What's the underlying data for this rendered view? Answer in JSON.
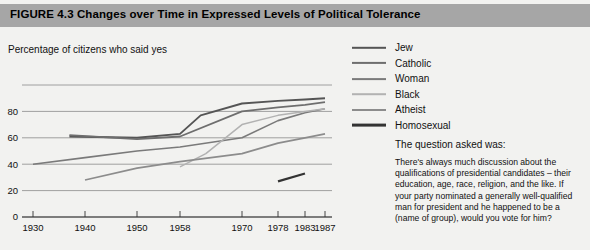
{
  "header": {
    "figure_number": "FIGURE 4.3",
    "title": "FIGURE 4.3  Changes over Time in Expressed Levels of Political Tolerance"
  },
  "axis_caption": "Percentage of citizens who said yes",
  "legend": {
    "items": [
      {
        "label": "Jew",
        "color": "#555555",
        "width": "2.4px"
      },
      {
        "label": "Catholic",
        "color": "#6e6e6e",
        "width": "2.2px"
      },
      {
        "label": "Woman",
        "color": "#7a7a7a",
        "width": "1.8px"
      },
      {
        "label": "Black",
        "color": "#b2b2b2",
        "width": "1.6px"
      },
      {
        "label": "Atheist",
        "color": "#8c8c8c",
        "width": "2.0px"
      },
      {
        "label": "Homosexual",
        "color": "#333333",
        "width": "2.8px"
      }
    ]
  },
  "question": {
    "heading": "The question asked was:",
    "lines": [
      "There's always much discussion about the",
      "qualifications of presidential candidates – their",
      "education, age, race, religion, and the like. If",
      "your party nominated a generally well-qualified",
      "man for president and he happened to be a",
      "(name of group), would you vote for him?"
    ]
  },
  "chart_data": {
    "type": "line",
    "title": "Changes over Time in Expressed Levels of Political Tolerance",
    "xlabel": "",
    "ylabel": "Percentage of citizens who said yes",
    "x_ticks": [
      1930,
      1940,
      1950,
      1958,
      1970,
      1978,
      1983,
      1987
    ],
    "x_tick_labels": [
      "1930",
      "1940",
      "1950",
      "1958",
      "1970",
      "1978",
      "1983",
      "1987"
    ],
    "x_tick_positions": [
      33,
      85,
      137,
      180,
      242,
      278,
      305,
      325
    ],
    "y_ticks": [
      0,
      20,
      40,
      60,
      80,
      100
    ],
    "y_tick_labels": [
      "0",
      "20",
      "40",
      "60",
      "80",
      ""
    ],
    "ylim": [
      0,
      100
    ],
    "grid": true,
    "legend_position": "right",
    "series": [
      {
        "name": "Jew",
        "color": "#555555",
        "stroke_width": 1.9,
        "points": [
          {
            "x": 1937,
            "y": 61
          },
          {
            "x": 1950,
            "y": 60
          },
          {
            "x": 1958,
            "y": 63
          },
          {
            "x": 1962,
            "y": 77
          },
          {
            "x": 1970,
            "y": 86
          },
          {
            "x": 1978,
            "y": 88
          },
          {
            "x": 1983,
            "y": 89
          },
          {
            "x": 1987,
            "y": 90
          }
        ]
      },
      {
        "name": "Catholic",
        "color": "#6e6e6e",
        "stroke_width": 1.8,
        "points": [
          {
            "x": 1937,
            "y": 62
          },
          {
            "x": 1950,
            "y": 59
          },
          {
            "x": 1958,
            "y": 61
          },
          {
            "x": 1970,
            "y": 80
          },
          {
            "x": 1978,
            "y": 83
          },
          {
            "x": 1983,
            "y": 85
          },
          {
            "x": 1987,
            "y": 87
          }
        ]
      },
      {
        "name": "Woman",
        "color": "#7a7a7a",
        "stroke_width": 1.6,
        "points": [
          {
            "x": 1930,
            "y": 40
          },
          {
            "x": 1940,
            "y": 45
          },
          {
            "x": 1950,
            "y": 50
          },
          {
            "x": 1958,
            "y": 53
          },
          {
            "x": 1970,
            "y": 60
          },
          {
            "x": 1978,
            "y": 73
          },
          {
            "x": 1983,
            "y": 79
          },
          {
            "x": 1987,
            "y": 82
          }
        ]
      },
      {
        "name": "Black",
        "color": "#b2b2b2",
        "stroke_width": 1.5,
        "points": [
          {
            "x": 1958,
            "y": 38
          },
          {
            "x": 1963,
            "y": 48
          },
          {
            "x": 1970,
            "y": 70
          },
          {
            "x": 1978,
            "y": 77
          },
          {
            "x": 1983,
            "y": 80
          },
          {
            "x": 1987,
            "y": 82
          }
        ]
      },
      {
        "name": "Atheist",
        "color": "#8c8c8c",
        "stroke_width": 1.7,
        "points": [
          {
            "x": 1940,
            "y": 28
          },
          {
            "x": 1950,
            "y": 37
          },
          {
            "x": 1958,
            "y": 42
          },
          {
            "x": 1970,
            "y": 48
          },
          {
            "x": 1978,
            "y": 56
          },
          {
            "x": 1983,
            "y": 60
          },
          {
            "x": 1987,
            "y": 63
          }
        ]
      },
      {
        "name": "Homosexual",
        "color": "#333333",
        "stroke_width": 2.2,
        "points": [
          {
            "x": 1978,
            "y": 27
          },
          {
            "x": 1983,
            "y": 33
          }
        ]
      }
    ]
  }
}
